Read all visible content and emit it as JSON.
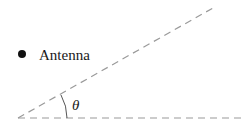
{
  "diagram": {
    "antenna_label": "Antenna",
    "angle_label": "θ",
    "colors": {
      "dash_line": "#9a9a9a",
      "text": "#1a1a1a",
      "dot": "#111111"
    }
  }
}
